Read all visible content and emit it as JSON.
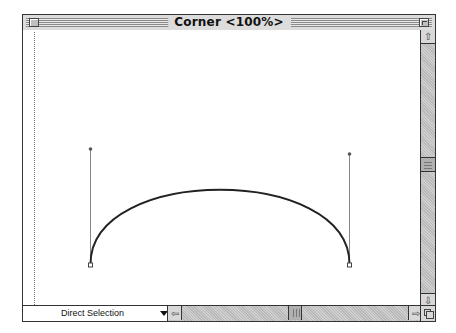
{
  "window": {
    "title": "Corner <100%>",
    "close_box_icon": "close-box-icon",
    "zoom_box_icon": "zoom-box-icon"
  },
  "status_bar": {
    "tool_label": "Direct Selection",
    "dropdown_icon": "triangle-down-icon"
  },
  "scrollbars": {
    "vertical": {
      "up_icon": "arrow-up-icon",
      "down_icon": "arrow-down-icon",
      "up_glyph": "⇧",
      "down_glyph": "⇩",
      "position_fraction": 0.5
    },
    "horizontal": {
      "left_icon": "arrow-left-icon",
      "right_icon": "arrow-right-icon",
      "left_glyph": "⇦",
      "right_glyph": "⇨",
      "position_fraction": 0.5
    }
  },
  "canvas": {
    "path_type": "bezier-arc",
    "anchor_points": 2,
    "direction_handles": 2,
    "page_edge_guide": "dotted"
  }
}
